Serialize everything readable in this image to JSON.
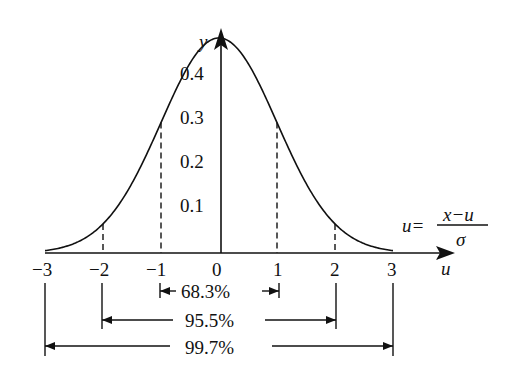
{
  "chart_data": {
    "type": "line",
    "title": "",
    "xlabel": "u",
    "ylabel": "y",
    "formula": {
      "lhs": "u=",
      "numerator": "x−u",
      "denominator": "σ"
    },
    "x_ticks": [
      "−3",
      "−2",
      "−1",
      "0",
      "1",
      "2",
      "3"
    ],
    "y_ticks": [
      "0.1",
      "0.2",
      "0.3",
      "0.4"
    ],
    "xlim": [
      -3,
      3
    ],
    "ylim": [
      0,
      0.4
    ],
    "grid": false,
    "series": [
      {
        "name": "standard normal pdf",
        "x": [
          -3,
          -2.5,
          -2,
          -1.5,
          -1,
          -0.5,
          0,
          0.5,
          1,
          1.5,
          2,
          2.5,
          3
        ],
        "y": [
          0.004,
          0.018,
          0.054,
          0.13,
          0.242,
          0.352,
          0.399,
          0.352,
          0.242,
          0.13,
          0.054,
          0.018,
          0.004
        ]
      }
    ],
    "dashed_lines_at": [
      -2,
      -1,
      1,
      2
    ],
    "intervals": [
      {
        "from": -1,
        "to": 1,
        "label": "68.3%"
      },
      {
        "from": -2,
        "to": 2,
        "label": "95.5%"
      },
      {
        "from": -3,
        "to": 3,
        "label": "99.7%"
      }
    ]
  },
  "labels": {
    "y_axis": "y",
    "x_axis": "u",
    "formula_lhs": "u=",
    "formula_num": "x−u",
    "formula_den": "σ",
    "x_ticks": [
      "−3",
      "−2",
      "−1",
      "0",
      "1",
      "2",
      "3"
    ],
    "y_ticks": [
      "0.1",
      "0.2",
      "0.3",
      "0.4"
    ],
    "int1": "68.3%",
    "int2": "95.5%",
    "int3": "99.7%"
  }
}
